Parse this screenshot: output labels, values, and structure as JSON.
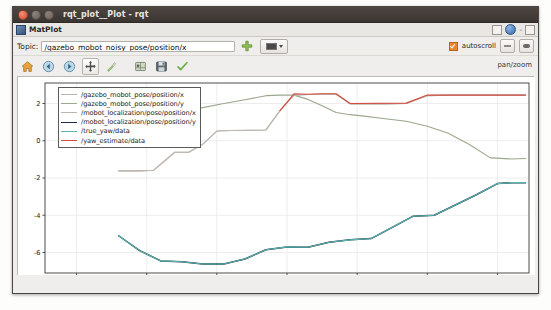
{
  "window": {
    "title": "rqt_plot__Plot - rqt",
    "controls": [
      "close-button",
      "minimize-button",
      "maximize-button"
    ]
  },
  "plugin": {
    "title": "MatPlot",
    "icon": "matplot-icon",
    "right_controls": [
      "float-button",
      "help-button",
      "close-button"
    ]
  },
  "topic_bar": {
    "label": "Topic:",
    "value": "/gazebo_mobot_noisy_pose/position/x",
    "placeholder": "/topic/field",
    "add_button_title": "add-topic",
    "combo_title": "line-style-selector",
    "autoscroll_label": "autoscroll",
    "autoscroll_checked": true,
    "right_buttons": [
      "config-button",
      "toggle-button"
    ]
  },
  "nav_toolbar": {
    "buttons": [
      {
        "name": "home-icon",
        "title": "Reset original view"
      },
      {
        "name": "back-arrow-icon",
        "title": "Back to previous view"
      },
      {
        "name": "forward-arrow-icon",
        "title": "Forward to next view"
      },
      {
        "name": "pan-move-icon",
        "title": "Pan axes with left mouse"
      },
      {
        "name": "zoom-rect-icon",
        "title": "Zoom to rectangle"
      },
      {
        "name": "subplot-config-icon",
        "title": "Configure subplots"
      },
      {
        "name": "save-disk-icon",
        "title": "Save the figure"
      },
      {
        "name": "check-green-icon",
        "title": "Toggle"
      }
    ],
    "mode_label": "pan/zoom"
  },
  "colors": {
    "accent_orange": "#e8862c",
    "series_1": "#b8b4ac",
    "series_2": "#9aa88c",
    "series_3": "#bfb6b0",
    "series_4": "#1f2e3d",
    "series_5": "#59b7b2",
    "series_6": "#d24c3f",
    "axis": "#3a3a3a",
    "grid": "#e8e8e8"
  },
  "chart_data": {
    "type": "line",
    "title": "",
    "xlabel": "",
    "ylabel": "",
    "xlim": [
      4425.5,
      4494.5
    ],
    "ylim": [
      -7.1,
      3.1
    ],
    "xticks": [
      4430,
      4440,
      4450,
      4460,
      4470,
      4480,
      4490
    ],
    "yticks": [
      2,
      0,
      -2,
      -4,
      -6
    ],
    "grid": true,
    "legend_position": "upper left",
    "series": [
      {
        "name": "/gazebo_mobot_pose/position/x",
        "color": "#b8b4ac",
        "x": [
          4436,
          4439,
          4441,
          4442.5,
          4444,
          4446,
          4448,
          4450,
          4452,
          4455,
          4457,
          4459,
          4461,
          4463,
          4465,
          4467,
          4469,
          4471,
          4474,
          4477,
          4480,
          4483,
          4486,
          4489,
          4492,
          4494
        ],
        "y": [
          -1.62,
          -1.62,
          -1.58,
          -1.1,
          -0.62,
          -0.62,
          -0.18,
          0.52,
          0.55,
          0.56,
          0.58,
          1.62,
          2.45,
          2.48,
          2.5,
          2.5,
          1.98,
          1.98,
          1.98,
          2.0,
          2.42,
          2.45,
          2.45,
          2.45,
          2.45,
          2.45
        ]
      },
      {
        "name": "/gazebo_mobot_pose/position/y",
        "color": "#9aa88c",
        "x": [
          4436,
          4439,
          4442,
          4445,
          4448,
          4451,
          4454,
          4457,
          4459,
          4461,
          4463,
          4465,
          4467,
          4469,
          4471,
          4474,
          4477,
          4480,
          4483,
          4486,
          4489,
          4492,
          4494
        ],
        "y": [
          0.95,
          1.22,
          1.35,
          1.58,
          1.78,
          2.0,
          2.2,
          2.42,
          2.45,
          2.45,
          2.22,
          1.88,
          1.52,
          1.4,
          1.32,
          1.18,
          1.05,
          0.78,
          0.4,
          -0.2,
          -0.92,
          -0.98,
          -0.95
        ]
      },
      {
        "name": "/mobot_localization/pose/position/x",
        "color": "#bfb6b0",
        "x": [
          4436,
          4439,
          4441,
          4442.5,
          4444,
          4446,
          4448,
          4450,
          4452,
          4455,
          4457,
          4459,
          4461,
          4463,
          4465,
          4467,
          4469,
          4471,
          4474,
          4477,
          4480,
          4483,
          4486,
          4489,
          4492,
          4494
        ],
        "y": [
          -1.62,
          -1.62,
          -1.58,
          -1.1,
          -0.62,
          -0.62,
          -0.18,
          0.52,
          0.55,
          0.56,
          0.58,
          1.62,
          2.45,
          2.48,
          2.5,
          2.5,
          1.98,
          1.98,
          1.98,
          2.0,
          2.42,
          2.45,
          2.45,
          2.45,
          2.45,
          2.45
        ]
      },
      {
        "name": "/mobot_localization/pose/position/y",
        "color": "#1f2e3d",
        "x": [
          4436,
          4439,
          4442,
          4445,
          4448,
          4451,
          4454,
          4457,
          4460,
          4463,
          4466,
          4469,
          4472,
          4475,
          4478,
          4481,
          4484,
          4487,
          4490,
          4492,
          4494
        ],
        "y": [
          -5.1,
          -5.9,
          -6.45,
          -6.5,
          -6.62,
          -6.62,
          -6.35,
          -5.85,
          -5.7,
          -5.72,
          -5.45,
          -5.32,
          -5.25,
          -4.65,
          -4.05,
          -4.0,
          -3.45,
          -2.9,
          -2.3,
          -2.25,
          -2.25
        ]
      },
      {
        "name": "/true_yaw/data",
        "color": "#59b7b2",
        "x": [
          4436,
          4439,
          4442,
          4445,
          4448,
          4451,
          4454,
          4457,
          4460,
          4463,
          4466,
          4469,
          4472,
          4475,
          4478,
          4481,
          4484,
          4487,
          4490,
          4492,
          4494
        ],
        "y": [
          -5.1,
          -5.9,
          -6.45,
          -6.5,
          -6.62,
          -6.62,
          -6.35,
          -5.85,
          -5.7,
          -5.72,
          -5.45,
          -5.32,
          -5.25,
          -4.65,
          -4.05,
          -4.0,
          -3.45,
          -2.9,
          -2.3,
          -2.25,
          -2.25
        ]
      },
      {
        "name": "/yaw_estimate/data",
        "color": "#d24c3f",
        "x": [
          4459,
          4461,
          4463,
          4465,
          4467,
          4469,
          4477,
          4480,
          4483,
          4486,
          4489,
          4492,
          4494
        ],
        "y": [
          1.62,
          2.52,
          2.5,
          2.52,
          2.52,
          2.0,
          2.02,
          2.45,
          2.45,
          2.45,
          2.45,
          2.45,
          2.45
        ]
      }
    ]
  }
}
